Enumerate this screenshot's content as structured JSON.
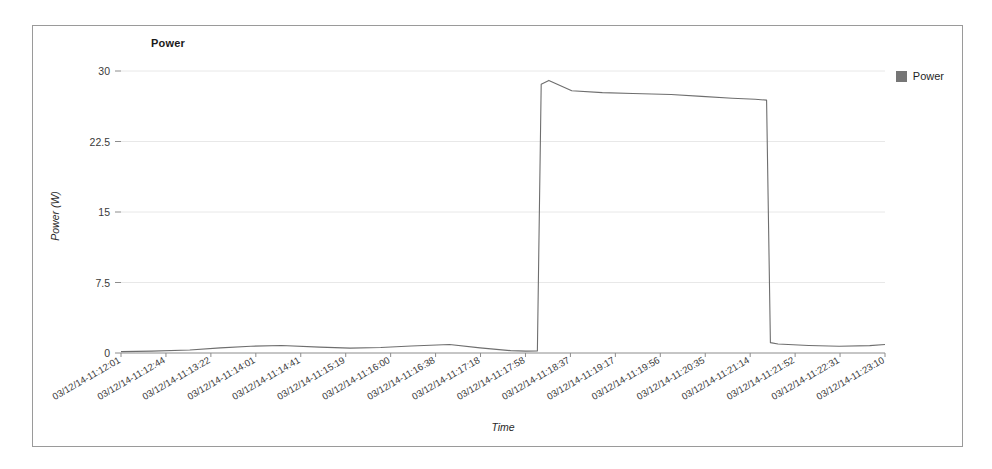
{
  "chart_data": {
    "type": "line",
    "title": "Power",
    "xlabel": "Time",
    "ylabel": "Power (W)",
    "ylim": [
      0,
      30
    ],
    "yticks": [
      0,
      7.5,
      15,
      22.5,
      30
    ],
    "ytick_labels": [
      "0",
      "7.5",
      "15",
      "22.5",
      "30"
    ],
    "grid": true,
    "legend": [
      {
        "name": "Power",
        "color": "#767676",
        "marker": "square"
      }
    ],
    "legend_position": "right",
    "categories": [
      "03/12/14-11:12:01",
      "03/12/14-11:12:44",
      "03/12/14-11:13:22",
      "03/12/14-11:14:01",
      "03/12/14-11:14:41",
      "03/12/14-11:15:19",
      "03/12/14-11:16:00",
      "03/12/14-11:16:38",
      "03/12/14-11:17:18",
      "03/12/14-11:17:58",
      "03/12/14-11:18:37",
      "03/12/14-11:19:17",
      "03/12/14-11:19:56",
      "03/12/14-11:20:35",
      "03/12/14-11:21:14",
      "03/12/14-11:21:52",
      "03/12/14-11:22:31",
      "03/12/14-11:23:10"
    ],
    "series": [
      {
        "name": "Power",
        "color": "#6e6e6e",
        "x": [
          0.0,
          0.04,
          0.09,
          0.13,
          0.17,
          0.21,
          0.26,
          0.3,
          0.34,
          0.38,
          0.43,
          0.47,
          0.51,
          0.53,
          0.545,
          0.55,
          0.56,
          0.59,
          0.63,
          0.67,
          0.72,
          0.76,
          0.8,
          0.83,
          0.845,
          0.85,
          0.86,
          0.9,
          0.94,
          0.98,
          1.0
        ],
        "values": [
          0.15,
          0.2,
          0.32,
          0.55,
          0.72,
          0.8,
          0.62,
          0.52,
          0.58,
          0.75,
          0.9,
          0.55,
          0.25,
          0.2,
          0.22,
          28.6,
          29.0,
          27.9,
          27.7,
          27.6,
          27.5,
          27.3,
          27.1,
          27.0,
          26.9,
          1.1,
          0.95,
          0.8,
          0.72,
          0.78,
          0.9
        ]
      }
    ],
    "annotations": [
      {
        "text": "pulse-1",
        "x_start": "11:15:30",
        "x_end": "11:17:45",
        "level": 28.0
      },
      {
        "text": "pulse-2",
        "x_start": "11:19:50",
        "x_end": "11:21:30",
        "level": 27.5
      }
    ],
    "pulses": [
      {
        "rise": 0.548,
        "fall": 0.838,
        "peak": 29.0,
        "plateau_start": 28.6,
        "plateau_end": 26.9
      },
      {
        "rise": 0.715,
        "fall": 0.857,
        "peak": 27.7,
        "plateau_start": 27.4,
        "plateau_end": 27.4
      }
    ]
  }
}
